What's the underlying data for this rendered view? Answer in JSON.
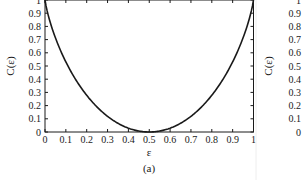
{
  "chart_data": [
    {
      "panel": "(a)",
      "type": "line",
      "title": "",
      "xlabel": "ε",
      "ylabel": "C(ε)",
      "caption": "(a)",
      "xlim": [
        0,
        1
      ],
      "ylim": [
        0,
        1
      ],
      "grid": false,
      "legend": null,
      "x_ticks": [
        "0",
        "0.1",
        "0.2",
        "0.3",
        "0.4",
        "0.5",
        "0.6",
        "0.7",
        "0.8",
        "0.9",
        "1"
      ],
      "y_ticks": [
        "0",
        "0.1",
        "0.2",
        "0.3",
        "0.4",
        "0.5",
        "0.6",
        "0.7",
        "0.8",
        "0.9",
        "1"
      ],
      "series": [
        {
          "name": "C(ε)",
          "color": "#1a1a1a",
          "x": [
            0,
            0.01,
            0.02,
            0.05,
            0.1,
            0.15,
            0.2,
            0.25,
            0.3,
            0.35,
            0.4,
            0.45,
            0.5,
            0.55,
            0.6,
            0.65,
            0.7,
            0.75,
            0.8,
            0.85,
            0.9,
            0.95,
            0.98,
            0.99,
            1
          ],
          "values": [
            1.0,
            0.919,
            0.859,
            0.714,
            0.531,
            0.39,
            0.278,
            0.189,
            0.119,
            0.066,
            0.029,
            0.007,
            0.0,
            0.007,
            0.029,
            0.066,
            0.119,
            0.189,
            0.278,
            0.39,
            0.531,
            0.714,
            0.859,
            0.919,
            1.0
          ]
        }
      ]
    },
    {
      "panel": "(b)",
      "type": "line",
      "partially_visible": true,
      "ylabel": "C(ε)",
      "y_ticks": [
        "0",
        "0.1",
        "0.2",
        "0.3",
        "0.4",
        "0.5",
        "0.6",
        "0.7",
        "0.8",
        "0.9",
        "1"
      ]
    }
  ]
}
